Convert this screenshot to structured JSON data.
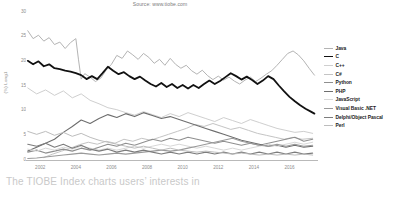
{
  "source_text": "Source: www.tiobe.com",
  "caption": "The TIOBE Index charts users’ interests in",
  "colors": {
    "java": "#b4b4b4",
    "c": "#111111",
    "cpp": "#cfcfcf",
    "csharp": "#c4c4c4",
    "python": "#8f8f8f",
    "php": "#6e6e6e",
    "javascript": "#d8d8d8",
    "visualbasic": "#9a9a9a",
    "delphi": "#7d7d7d",
    "perl": "#bdbdbd",
    "axis": "#b9b9b9",
    "tick_text": "#8d8d8d",
    "caption_text": "#c9c9c9",
    "source_text": "#7a7a7a"
  },
  "chart_data": {
    "type": "line",
    "title": "",
    "subtitle": "Source: www.tiobe.com",
    "xlabel": "",
    "ylabel": "(%) Long1",
    "xlim": [
      2001.2,
      2017.6
    ],
    "ylim": [
      0,
      30
    ],
    "yticks": [
      30,
      25,
      20,
      15,
      10,
      5,
      0
    ],
    "xticks": [
      2002,
      2004,
      2006,
      2008,
      2010,
      2012,
      2014,
      2016
    ],
    "grid": false,
    "legend_position": "right",
    "legend": [
      "Java",
      "C",
      "C++",
      "C#",
      "Python",
      "PHP",
      "JavaScript",
      "Visual Basic .NET",
      "Delphi/Object Pascal",
      "Perl"
    ],
    "series": [
      {
        "name": "Java",
        "key": "java",
        "width": 1.0,
        "x": [
          2001.3,
          2001.6,
          2001.9,
          2002.2,
          2002.5,
          2002.8,
          2003.1,
          2003.4,
          2003.7,
          2004.0,
          2004.15,
          2004.3,
          2004.5,
          2004.8,
          2005.1,
          2005.4,
          2005.7,
          2006.0,
          2006.3,
          2006.6,
          2006.9,
          2007.2,
          2007.5,
          2007.8,
          2008.1,
          2008.4,
          2008.7,
          2009.0,
          2009.3,
          2009.6,
          2009.9,
          2010.2,
          2010.5,
          2010.8,
          2011.1,
          2011.4,
          2011.7,
          2012.0,
          2012.3,
          2012.6,
          2012.9,
          2013.2,
          2013.5,
          2013.8,
          2014.1,
          2014.4,
          2014.7,
          2015.0,
          2015.3,
          2015.6,
          2015.9,
          2016.2,
          2016.5,
          2016.8,
          2017.1,
          2017.4
        ],
        "y": [
          26.2,
          24.6,
          25.3,
          24.1,
          24.8,
          23.4,
          23.9,
          22.6,
          23.8,
          24.6,
          20.3,
          16.4,
          17.5,
          16.8,
          15.9,
          16.6,
          18.2,
          19.4,
          21.2,
          20.6,
          22.1,
          21.3,
          20.4,
          21.6,
          20.8,
          19.6,
          20.4,
          19.2,
          20.6,
          19.4,
          18.6,
          19.2,
          18.1,
          17.4,
          18.2,
          17.1,
          16.3,
          17.0,
          16.2,
          16.8,
          16.0,
          15.4,
          16.2,
          16.8,
          15.9,
          16.6,
          17.4,
          18.1,
          19.2,
          20.4,
          21.6,
          22.1,
          21.3,
          20.1,
          18.6,
          17.2
        ]
      },
      {
        "name": "C",
        "key": "c",
        "width": 1.8,
        "x": [
          2001.3,
          2001.6,
          2001.9,
          2002.2,
          2002.5,
          2002.8,
          2003.1,
          2003.4,
          2003.7,
          2004.0,
          2004.3,
          2004.6,
          2004.9,
          2005.2,
          2005.5,
          2005.8,
          2006.1,
          2006.4,
          2006.7,
          2007.0,
          2007.3,
          2007.6,
          2007.9,
          2008.2,
          2008.5,
          2008.8,
          2009.1,
          2009.4,
          2009.7,
          2010.0,
          2010.3,
          2010.6,
          2010.9,
          2011.2,
          2011.5,
          2011.8,
          2012.1,
          2012.4,
          2012.7,
          2013.0,
          2013.3,
          2013.6,
          2013.9,
          2014.2,
          2014.5,
          2014.8,
          2015.1,
          2015.4,
          2015.7,
          2016.0,
          2016.3,
          2016.6,
          2016.9,
          2017.2,
          2017.4
        ],
        "y": [
          20.1,
          19.4,
          20.0,
          19.0,
          19.4,
          18.6,
          18.4,
          18.1,
          17.9,
          17.6,
          17.2,
          16.4,
          17.0,
          16.4,
          17.6,
          18.9,
          18.1,
          17.4,
          17.8,
          17.0,
          16.4,
          16.9,
          16.1,
          15.4,
          14.9,
          15.6,
          14.8,
          15.4,
          14.6,
          15.2,
          14.5,
          15.2,
          14.6,
          15.4,
          16.1,
          15.4,
          16.0,
          16.8,
          17.6,
          17.0,
          16.3,
          16.9,
          16.2,
          15.4,
          16.1,
          17.0,
          16.4,
          15.1,
          13.9,
          12.8,
          11.9,
          11.1,
          10.4,
          9.8,
          9.4
        ]
      },
      {
        "name": "C++",
        "key": "cpp",
        "width": 1.0,
        "x": [
          2001.3,
          2001.8,
          2002.3,
          2002.8,
          2003.3,
          2003.8,
          2004.3,
          2004.8,
          2005.3,
          2005.8,
          2006.3,
          2006.8,
          2007.3,
          2007.8,
          2008.3,
          2008.8,
          2009.3,
          2009.8,
          2010.3,
          2010.8,
          2011.3,
          2011.8,
          2012.3,
          2012.8,
          2013.3,
          2013.8,
          2014.3,
          2014.8,
          2015.3,
          2015.8,
          2016.3,
          2016.8,
          2017.3
        ],
        "y": [
          14.6,
          13.4,
          14.2,
          13.1,
          14.0,
          12.6,
          13.4,
          12.1,
          11.4,
          10.6,
          10.2,
          9.6,
          9.1,
          9.8,
          9.2,
          8.6,
          9.4,
          8.8,
          9.6,
          9.0,
          8.4,
          7.8,
          8.6,
          8.0,
          7.4,
          8.2,
          7.6,
          7.0,
          6.4,
          6.0,
          5.6,
          5.8,
          5.4
        ]
      },
      {
        "name": "C#",
        "key": "csharp",
        "width": 1.0,
        "x": [
          2002.2,
          2002.7,
          2003.2,
          2003.7,
          2004.2,
          2004.7,
          2005.2,
          2005.7,
          2006.2,
          2006.7,
          2007.2,
          2007.7,
          2008.2,
          2008.7,
          2009.2,
          2009.7,
          2010.2,
          2010.7,
          2011.2,
          2011.7,
          2012.2,
          2012.7,
          2013.2,
          2013.7,
          2014.2,
          2014.7,
          2015.2,
          2015.7,
          2016.2,
          2016.7,
          2017.3
        ],
        "y": [
          0.5,
          1.2,
          1.8,
          2.4,
          3.1,
          3.6,
          3.2,
          3.8,
          3.4,
          4.2,
          3.8,
          4.4,
          4.0,
          4.6,
          5.2,
          5.8,
          6.4,
          7.2,
          6.8,
          7.4,
          6.8,
          6.2,
          6.6,
          6.0,
          5.4,
          5.0,
          4.6,
          4.2,
          4.6,
          4.2,
          4.4
        ]
      },
      {
        "name": "Python",
        "key": "python",
        "width": 1.1,
        "x": [
          2001.3,
          2001.8,
          2002.3,
          2002.8,
          2003.3,
          2003.8,
          2004.3,
          2004.8,
          2005.3,
          2005.8,
          2006.3,
          2006.8,
          2007.3,
          2007.8,
          2008.3,
          2008.8,
          2009.3,
          2009.8,
          2010.3,
          2010.8,
          2011.3,
          2011.8,
          2012.3,
          2012.8,
          2013.3,
          2013.8,
          2014.3,
          2014.8,
          2015.3,
          2015.8,
          2016.3,
          2016.8,
          2017.3
        ],
        "y": [
          1.6,
          2.0,
          1.4,
          1.8,
          2.2,
          1.8,
          2.4,
          2.0,
          2.6,
          3.2,
          2.8,
          3.4,
          3.0,
          3.6,
          4.2,
          3.8,
          4.4,
          4.0,
          4.6,
          4.2,
          3.8,
          3.4,
          3.8,
          3.4,
          3.0,
          3.4,
          3.0,
          3.4,
          3.8,
          4.2,
          4.6,
          3.8,
          4.2
        ]
      },
      {
        "name": "PHP",
        "key": "php",
        "width": 1.1,
        "x": [
          2001.3,
          2001.8,
          2002.3,
          2002.8,
          2003.3,
          2003.8,
          2004.3,
          2004.8,
          2005.3,
          2005.8,
          2006.3,
          2006.8,
          2007.3,
          2007.8,
          2008.3,
          2008.8,
          2009.3,
          2009.8,
          2010.3,
          2010.8,
          2011.3,
          2011.8,
          2012.3,
          2012.8,
          2013.3,
          2013.8,
          2014.3,
          2014.8,
          2015.3,
          2015.8,
          2016.3,
          2016.8,
          2017.3
        ],
        "y": [
          1.8,
          2.6,
          3.4,
          4.2,
          5.6,
          6.8,
          8.1,
          7.4,
          8.4,
          9.2,
          8.6,
          9.4,
          8.8,
          9.6,
          9.0,
          8.4,
          8.8,
          8.2,
          7.6,
          7.0,
          6.4,
          5.8,
          5.2,
          4.6,
          4.0,
          3.6,
          3.2,
          2.8,
          3.0,
          2.6,
          3.0,
          2.6,
          2.8
        ]
      },
      {
        "name": "JavaScript",
        "key": "javascript",
        "width": 1.0,
        "x": [
          2001.3,
          2001.8,
          2002.3,
          2002.8,
          2003.3,
          2003.8,
          2004.3,
          2004.8,
          2005.3,
          2005.8,
          2006.3,
          2006.8,
          2007.3,
          2007.8,
          2008.3,
          2008.8,
          2009.3,
          2009.8,
          2010.3,
          2010.8,
          2011.3,
          2011.8,
          2012.3,
          2012.8,
          2013.3,
          2013.8,
          2014.3,
          2014.8,
          2015.3,
          2015.8,
          2016.3,
          2016.8,
          2017.3
        ],
        "y": [
          2.2,
          1.8,
          2.4,
          2.0,
          2.6,
          2.2,
          2.8,
          2.4,
          2.0,
          2.4,
          2.0,
          2.4,
          2.8,
          2.4,
          2.8,
          3.2,
          2.8,
          3.2,
          2.8,
          2.4,
          2.8,
          2.4,
          2.0,
          2.4,
          2.0,
          2.4,
          2.8,
          3.2,
          2.8,
          3.2,
          3.6,
          3.2,
          3.6
        ]
      },
      {
        "name": "Visual Basic .NET",
        "key": "visualbasic",
        "width": 1.1,
        "x": [
          2001.3,
          2001.8,
          2002.3,
          2002.8,
          2003.3,
          2003.8,
          2004.3,
          2004.8,
          2005.3,
          2005.8,
          2006.3,
          2006.8,
          2007.3,
          2007.8,
          2008.3,
          2008.8,
          2009.3,
          2009.8,
          2010.3,
          2010.8,
          2011.3,
          2011.8,
          2012.3,
          2012.8,
          2013.3,
          2013.8,
          2014.3,
          2014.8,
          2015.3,
          2015.8,
          2016.3,
          2016.8,
          2017.3
        ],
        "y": [
          0.3,
          0.4,
          0.6,
          0.8,
          1.0,
          1.2,
          1.4,
          1.2,
          1.0,
          1.2,
          1.4,
          1.2,
          1.4,
          1.6,
          1.8,
          2.0,
          1.8,
          2.0,
          2.4,
          2.8,
          3.2,
          3.6,
          4.0,
          4.4,
          3.8,
          3.4,
          3.0,
          2.8,
          3.2,
          2.8,
          3.2,
          2.8,
          3.0
        ]
      },
      {
        "name": "Delphi/Object Pascal",
        "key": "delphi",
        "width": 1.1,
        "x": [
          2001.3,
          2001.8,
          2002.3,
          2002.8,
          2003.3,
          2003.8,
          2004.3,
          2004.8,
          2005.3,
          2005.8,
          2006.3,
          2006.8,
          2007.3,
          2007.8,
          2008.3,
          2008.8,
          2009.3,
          2009.8,
          2010.3,
          2010.8,
          2011.3,
          2011.8,
          2012.3,
          2012.8,
          2013.3,
          2013.8,
          2014.3,
          2014.8,
          2015.3,
          2015.8,
          2016.3,
          2016.8,
          2017.3
        ],
        "y": [
          3.2,
          2.8,
          3.4,
          2.6,
          3.2,
          2.4,
          3.0,
          2.2,
          1.8,
          2.2,
          1.6,
          2.0,
          1.6,
          2.0,
          1.6,
          1.2,
          1.6,
          1.2,
          1.6,
          1.2,
          1.6,
          1.2,
          1.6,
          1.2,
          1.6,
          1.2,
          1.6,
          1.2,
          1.6,
          1.2,
          1.6,
          1.2,
          1.4
        ]
      },
      {
        "name": "Perl",
        "key": "perl",
        "width": 1.0,
        "x": [
          2001.3,
          2001.8,
          2002.3,
          2002.8,
          2003.3,
          2003.8,
          2004.3,
          2004.8,
          2005.3,
          2005.8,
          2006.3,
          2006.8,
          2007.3,
          2007.8,
          2008.3,
          2008.8,
          2009.3,
          2009.8,
          2010.3,
          2010.8,
          2011.3,
          2011.8,
          2012.3,
          2012.8,
          2013.3,
          2013.8,
          2014.3,
          2014.8,
          2015.3,
          2015.8,
          2016.3,
          2016.8,
          2017.3
        ],
        "y": [
          5.8,
          5.2,
          5.8,
          5.0,
          5.6,
          4.8,
          5.4,
          4.6,
          4.0,
          3.6,
          3.2,
          2.8,
          2.4,
          2.8,
          2.4,
          2.0,
          2.4,
          2.0,
          1.8,
          1.6,
          1.8,
          1.6,
          1.4,
          1.2,
          1.4,
          1.2,
          1.0,
          1.2,
          1.0,
          1.2,
          1.0,
          1.2,
          1.0
        ]
      }
    ]
  }
}
